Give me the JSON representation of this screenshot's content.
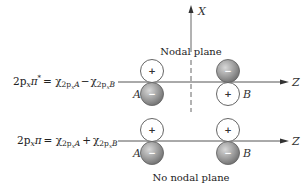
{
  "diagram": {
    "axes": {
      "vertical_label": "X",
      "horizontal_label": "Z"
    },
    "top_row": {
      "equation_lhs": "2p",
      "equation_lhs_sub": "x",
      "equation_lhs_sym": "π",
      "equation_lhs_sup": "*",
      "equation_rhs": "= χ",
      "equation_term1_sub": "2p",
      "equation_term1_subsub": "x",
      "equation_term1_atom": "A",
      "operator": "−",
      "equation_term2_sub": "2p",
      "equation_term2_subsub": "x",
      "equation_term2_atom": "B",
      "caption": "Nodal plane",
      "atom_left": "A",
      "atom_right": "B",
      "left_upper_sign": "+",
      "left_lower_sign": "−",
      "right_upper_sign": "−",
      "right_lower_sign": "+"
    },
    "bottom_row": {
      "equation_lhs": "2p",
      "equation_lhs_sub": "x",
      "equation_lhs_sym": "π",
      "equation_rhs": "= χ",
      "equation_term1_sub": "2p",
      "equation_term1_subsub": "x",
      "equation_term1_atom": "A",
      "operator": "+",
      "equation_term2_sub": "2p",
      "equation_term2_subsub": "x",
      "equation_term2_atom": "B",
      "caption": "No nodal plane",
      "atom_left": "A",
      "atom_right": "B",
      "left_upper_sign": "+",
      "left_lower_sign": "−",
      "right_upper_sign": "+",
      "right_lower_sign": "−"
    },
    "colors": {
      "positive_lobe_fill": "#ffffff",
      "negative_lobe_fill": "#9a9a9a",
      "line": "#555555"
    }
  }
}
